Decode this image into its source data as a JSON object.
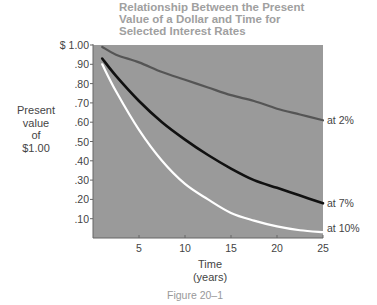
{
  "chart_data": {
    "type": "line",
    "title": "Relationship Between the Present Value of a Dollar and Time for Selected Interest Rates",
    "title_lines": [
      "Relationship Between the Present",
      "Value of a Dollar and Time for",
      "Selected Interest Rates"
    ],
    "xlabel_lines": [
      "Time",
      "(years)"
    ],
    "ylabel_lines": [
      "Present",
      "value",
      "of",
      "$1.00"
    ],
    "caption": "Figure 20–1",
    "xlim": [
      0,
      25
    ],
    "ylim": [
      0,
      1.0
    ],
    "x_ticks": [
      5,
      10,
      15,
      20,
      25
    ],
    "x_tick_labels": [
      "5",
      "10",
      "15",
      "20",
      "25"
    ],
    "y_ticks": [
      0.1,
      0.2,
      0.3,
      0.4,
      0.5,
      0.6,
      0.7,
      0.8,
      0.9,
      1.0
    ],
    "y_tick_labels": [
      ".10",
      ".20",
      ".30",
      ".40",
      ".50",
      ".60",
      ".70",
      ".80",
      ".90",
      "$ 1.00"
    ],
    "grid": false,
    "legend_position": "inline-right",
    "x": [
      1,
      2.5,
      5,
      7.5,
      10,
      12.5,
      15,
      17.5,
      20,
      22.5,
      25
    ],
    "series": [
      {
        "name": "at 2%",
        "color": "#555555",
        "values": [
          0.99,
          0.95,
          0.91,
          0.86,
          0.82,
          0.78,
          0.74,
          0.71,
          0.67,
          0.64,
          0.61
        ]
      },
      {
        "name": "at 7%",
        "color": "#111111",
        "values": [
          0.93,
          0.84,
          0.71,
          0.6,
          0.51,
          0.43,
          0.36,
          0.3,
          0.26,
          0.22,
          0.18
        ]
      },
      {
        "name": "at 10%",
        "color": "#ffffff",
        "values": [
          0.9,
          0.76,
          0.56,
          0.4,
          0.28,
          0.2,
          0.13,
          0.09,
          0.06,
          0.04,
          0.03
        ]
      }
    ],
    "plot_background": "#9a9a9a"
  }
}
